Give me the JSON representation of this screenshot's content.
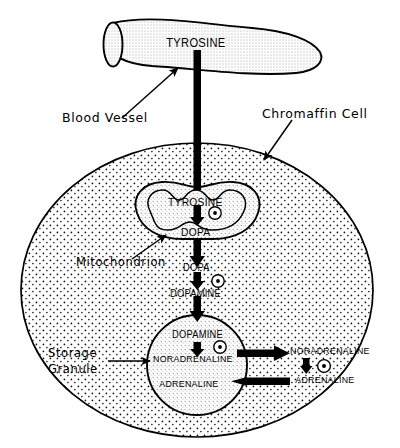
{
  "figure": {
    "type": "biological-pathway-diagram",
    "background_color": "#ffffff",
    "ink_color": "#000000",
    "cytoplasm_fill": "stipple-dots"
  },
  "annotations": {
    "blood_vessel": "Blood Vessel",
    "chromaffin_cell": "Chromaffin Cell",
    "mitochondrion": "Mitochondrion",
    "storage_granule_line1": "Storage",
    "storage_granule_line2": "Granule"
  },
  "pathway": {
    "vessel_label": "TYROSINE",
    "mitochondrion": {
      "substrate": "TYROSINE",
      "product": "DOPA",
      "enzyme_marker": "a"
    },
    "cytoplasm": {
      "substrate": "DOPA",
      "product": "DOPAMINE",
      "enzyme_marker": "b"
    },
    "granule": {
      "substrate": "DOPAMINE",
      "intermediate": "NORADRENALINE",
      "product": "ADRENALINE",
      "enzyme_marker": "c"
    },
    "cytosol_right": {
      "substrate": "NORADRENALINE",
      "product": "ADRENALINE",
      "enzyme_marker": "d"
    }
  },
  "arrows": [
    {
      "name": "tyrosine-uptake",
      "from": "blood vessel",
      "to": "mitochondrion",
      "direction": "down"
    },
    {
      "name": "tyrosine-to-dopa",
      "from": "TYROSINE",
      "to": "DOPA",
      "direction": "down"
    },
    {
      "name": "dopa-export",
      "from": "mitochondrion",
      "to": "cytoplasm",
      "direction": "down"
    },
    {
      "name": "dopa-to-dopamine",
      "from": "DOPA",
      "to": "DOPAMINE",
      "direction": "down"
    },
    {
      "name": "dopamine-uptake",
      "from": "cytoplasm",
      "to": "storage granule",
      "direction": "down"
    },
    {
      "name": "dopamine-to-noradrenaline",
      "from": "DOPAMINE",
      "to": "NORADRENALINE",
      "direction": "down"
    },
    {
      "name": "noradrenaline-export",
      "from": "granule",
      "to": "cytosol",
      "direction": "right"
    },
    {
      "name": "noradrenaline-to-adrenaline",
      "from": "NORADRENALINE",
      "to": "ADRENALINE",
      "direction": "down"
    },
    {
      "name": "adrenaline-reuptake",
      "from": "cytosol",
      "to": "granule",
      "direction": "left"
    }
  ]
}
